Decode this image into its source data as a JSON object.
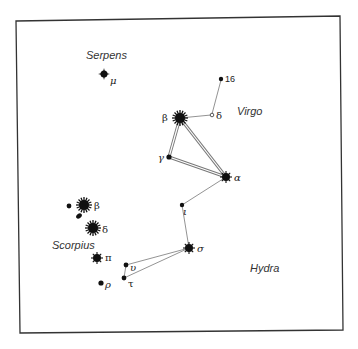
{
  "frame": {
    "stroke": "#333333"
  },
  "constellations": {
    "serpens": {
      "label": "Serpens"
    },
    "virgo": {
      "label": "Virgo"
    },
    "scorpius": {
      "label": "Scorpius"
    },
    "hydra": {
      "label": "Hydra"
    }
  },
  "stars": {
    "serpens_mu": {
      "label": "μ"
    },
    "virgo_16": {
      "label": "16"
    },
    "virgo_delta": {
      "label": "δ"
    },
    "virgo_beta": {
      "label": "β"
    },
    "virgo_gamma": {
      "label": "γ"
    },
    "virgo_alpha": {
      "label": "α"
    },
    "iota": {
      "label": "ι"
    },
    "hydra_sigma": {
      "label": "σ"
    },
    "upsilon": {
      "label": "υ"
    },
    "tau": {
      "label": "τ"
    },
    "scorpius_beta": {
      "label": "β"
    },
    "scorpius_delta": {
      "label": "δ"
    },
    "scorpius_pi": {
      "label": "π"
    },
    "scorpius_rho": {
      "label": "ρ"
    }
  },
  "colors": {
    "star": "#111111",
    "line": "#777777",
    "background": "#ffffff"
  }
}
